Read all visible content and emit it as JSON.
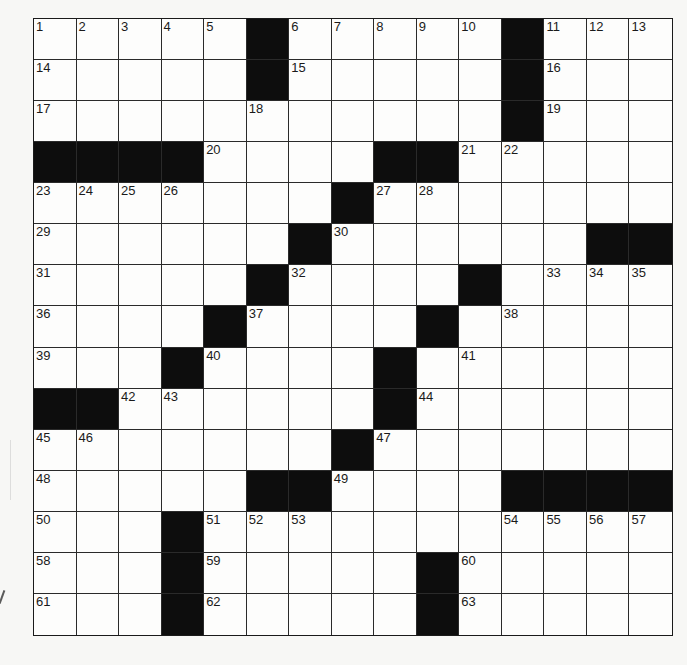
{
  "puzzle": {
    "rows": 15,
    "cols": 15,
    "colors": {
      "black_square": "#0d0d0d",
      "white_square": "#fdfdfc",
      "grid_line": "#2a2a2a",
      "number_text": "#1a1a1a"
    },
    "layout": [
      ".....#.....#...",
      ".....#.....#...",
      "...........#...",
      "####....##.....",
      ".......#.......",
      "......#......##",
      ".....#....#....",
      "....#....#.....",
      "...#....#......",
      "##......#......",
      ".......#.......",
      ".....##....####",
      "...#...........",
      "...#.....#.....",
      "...#.....#....."
    ],
    "numbers": [
      [
        1,
        2,
        3,
        4,
        5,
        0,
        6,
        7,
        8,
        9,
        10,
        0,
        11,
        12,
        13
      ],
      [
        14,
        0,
        0,
        0,
        0,
        0,
        15,
        0,
        0,
        0,
        0,
        0,
        16,
        0,
        0
      ],
      [
        17,
        0,
        0,
        0,
        0,
        18,
        0,
        0,
        0,
        0,
        0,
        0,
        19,
        0,
        0
      ],
      [
        0,
        0,
        0,
        0,
        20,
        0,
        0,
        0,
        0,
        0,
        21,
        22,
        0,
        0,
        0
      ],
      [
        23,
        24,
        25,
        26,
        0,
        0,
        0,
        0,
        27,
        28,
        0,
        0,
        0,
        0,
        0
      ],
      [
        29,
        0,
        0,
        0,
        0,
        0,
        0,
        30,
        0,
        0,
        0,
        0,
        0,
        0,
        0
      ],
      [
        31,
        0,
        0,
        0,
        0,
        0,
        32,
        0,
        0,
        0,
        0,
        0,
        33,
        34,
        35
      ],
      [
        36,
        0,
        0,
        0,
        0,
        37,
        0,
        0,
        0,
        0,
        0,
        38,
        0,
        0,
        0
      ],
      [
        39,
        0,
        0,
        0,
        40,
        0,
        0,
        0,
        0,
        0,
        41,
        0,
        0,
        0,
        0
      ],
      [
        0,
        0,
        42,
        43,
        0,
        0,
        0,
        0,
        0,
        44,
        0,
        0,
        0,
        0,
        0
      ],
      [
        45,
        46,
        0,
        0,
        0,
        0,
        0,
        0,
        47,
        0,
        0,
        0,
        0,
        0,
        0
      ],
      [
        48,
        0,
        0,
        0,
        0,
        0,
        0,
        49,
        0,
        0,
        0,
        0,
        0,
        0,
        0
      ],
      [
        50,
        0,
        0,
        0,
        51,
        52,
        53,
        0,
        0,
        0,
        0,
        54,
        55,
        56,
        57
      ],
      [
        58,
        0,
        0,
        0,
        59,
        0,
        0,
        0,
        0,
        0,
        60,
        0,
        0,
        0,
        0
      ],
      [
        61,
        0,
        0,
        0,
        62,
        0,
        0,
        0,
        0,
        0,
        63,
        0,
        0,
        0,
        0
      ]
    ],
    "entries": []
  }
}
